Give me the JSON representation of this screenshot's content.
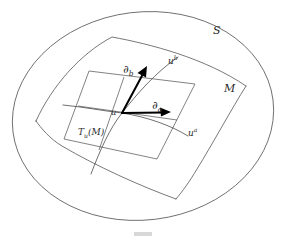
{
  "figure": {
    "type": "geometry-diagram",
    "background_color": "#ffffff",
    "line_color": "#4a4a4a",
    "vector_color": "#000000",
    "width": 286,
    "height": 239
  },
  "labels": {
    "ambient_space": "S",
    "manifold": "M",
    "base_point": "u",
    "coordinate_curve_a_base": "u",
    "coordinate_curve_a_sup": "a",
    "coordinate_curve_b_base": "u",
    "coordinate_curve_b_sup": "b",
    "basis_vector_a_base": "∂",
    "basis_vector_a_sub": "a",
    "basis_vector_b_base": "∂",
    "basis_vector_b_sub": "b",
    "tangent_space_base": "T",
    "tangent_space_sub": "u",
    "tangent_space_arg": "(M)"
  },
  "geometry": {
    "ambient_ellipse": {
      "cx": 143,
      "cy": 116,
      "rx": 131,
      "ry": 105,
      "rotation_deg": -8
    },
    "manifold_sheet": {
      "corners": [
        [
          36,
          121
        ],
        [
          112,
          37
        ],
        [
          246,
          86
        ],
        [
          176,
          199
        ]
      ],
      "description": "curved quadrilateral patch"
    },
    "tangent_plane": {
      "corners": [
        [
          64,
          139
        ],
        [
          89,
          71
        ],
        [
          195,
          84
        ],
        [
          157,
          159
        ]
      ],
      "description": "flat parallelogram tangent at u"
    },
    "base_point_xy": [
      122,
      113
    ],
    "vector_da": {
      "from": [
        122,
        113
      ],
      "to": [
        168,
        112
      ],
      "label": "∂a"
    },
    "vector_db": {
      "from": [
        122,
        113
      ],
      "to": [
        146,
        69
      ],
      "label": "∂b"
    }
  }
}
